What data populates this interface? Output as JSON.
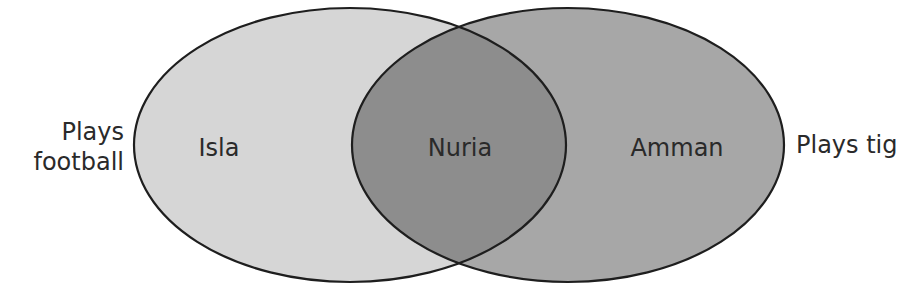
{
  "diagram": {
    "type": "venn",
    "sets": [
      {
        "id": "football",
        "label_line1": "Plays",
        "label_line2": "football",
        "color": "#d6d6d6"
      },
      {
        "id": "tig",
        "label": "Plays tig",
        "color": "#a7a7a7"
      }
    ],
    "overlap_color": "#8d8d8d",
    "outline_color": "#1e1e1e",
    "regions": {
      "football_only": "Isla",
      "both": "Nuria",
      "tig_only": "Amman"
    }
  }
}
